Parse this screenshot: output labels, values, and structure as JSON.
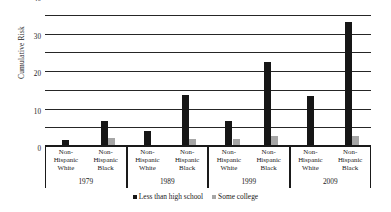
{
  "chart_data": {
    "type": "bar",
    "title": "",
    "xlabel": "",
    "ylabel": "Cumulative Risk",
    "ylim": [
      0,
      70
    ],
    "yticks": [
      0,
      10,
      20,
      30,
      40,
      50,
      60,
      70
    ],
    "grid": true,
    "legend_position": "bottom-center",
    "groups": [
      {
        "year": "1979",
        "categories": [
          "Non-Hispanic White",
          "Non-Hispanic Black"
        ]
      },
      {
        "year": "1989",
        "categories": [
          "Non-Hispanic White",
          "Non-Hispanic Black"
        ]
      },
      {
        "year": "1999",
        "categories": [
          "Non-Hispanic White",
          "Non-Hispanic Black"
        ]
      },
      {
        "year": "2009",
        "categories": [
          "Non-Hispanic White",
          "Non-Hispanic Black"
        ]
      }
    ],
    "categories": [
      "1979 Non-Hispanic White",
      "1979 Non-Hispanic Black",
      "1989 Non-Hispanic White",
      "1989 Non-Hispanic Black",
      "1999 Non-Hispanic White",
      "1999 Non-Hispanic Black",
      "2009 Non-Hispanic White",
      "2009 Non-Hispanic Black"
    ],
    "series": [
      {
        "name": "Less than high school",
        "color": "#161616",
        "values": [
          3.5,
          14,
          8.5,
          28,
          14,
          45.5,
          27.5,
          67
        ]
      },
      {
        "name": "Some college",
        "color": "#a6a6a6",
        "values": [
          0,
          5,
          0,
          4.5,
          4.5,
          6,
          1,
          6
        ]
      }
    ],
    "category_line1": "Non-",
    "category_line2": "Hispanic",
    "category_line3_white": "White",
    "category_line3_black": "Black"
  },
  "legend": {
    "items": [
      {
        "label": "Less than high school"
      },
      {
        "label": "Some college"
      }
    ]
  },
  "axis": {
    "y_title": "Cumulative Risk"
  }
}
